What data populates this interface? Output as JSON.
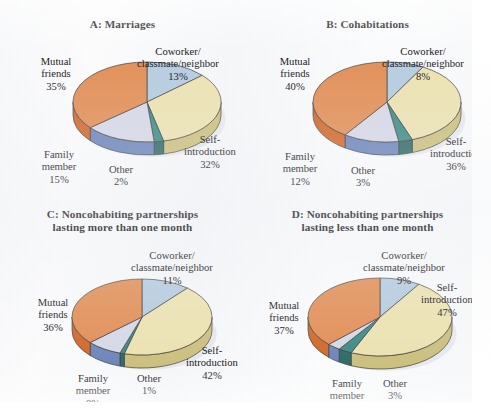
{
  "figure": {
    "background_color": "#f7f8fa",
    "text_color": "#17171a"
  },
  "palette": {
    "coworker": "#b6cce0",
    "coworker_side": "#8fa9c4",
    "self_introduction": "#ece2b2",
    "self_introduction_side": "#ccc07f",
    "other": "#3f8c87",
    "other_side": "#2e6c68",
    "family_member": "#d6d9e6",
    "family_member_side": "#6e86bb",
    "mutual_friends": "#e29058",
    "mutual_friends_side": "#d2692b",
    "outline": "#3d3d3d",
    "shadow": "#d9dde2"
  },
  "categories": [
    "Coworker/\nclassmate/neighbor",
    "Self-\nintroduction",
    "Other",
    "Family\nmember",
    "Mutual\nfriends"
  ],
  "panels": [
    {
      "id": "A",
      "title": "A: Marriages",
      "labels": {
        "mutual_friends": "Mutual\nfriends",
        "mutual_friends_pct": "35%",
        "coworker": "Coworker/\nclassmate/neighbor",
        "coworker_pct": "13%",
        "self_introduction": "Self-\nintroduction",
        "self_introduction_pct": "32%",
        "other": "Other",
        "other_pct": "2%",
        "family_member": "Family\nmember",
        "family_member_pct": "15%"
      }
    },
    {
      "id": "B",
      "title": "B: Cohabitations",
      "labels": {
        "mutual_friends": "Mutual\nfriends",
        "mutual_friends_pct": "40%",
        "coworker": "Coworker/\nclassmate/neighbor",
        "coworker_pct": "8%",
        "self_introduction": "Self-\nintroduction",
        "self_introduction_pct": "36%",
        "other": "Other",
        "other_pct": "3%",
        "family_member": "Family\nmember",
        "family_member_pct": "12%"
      }
    },
    {
      "id": "C",
      "title": "C: Noncohabiting partnerships\nlasting more than one month",
      "labels": {
        "mutual_friends": "Mutual\nfriends",
        "mutual_friends_pct": "36%",
        "coworker": "Coworker/\nclassmate/neighbor",
        "coworker_pct": "11%",
        "self_introduction": "Self-\nintroduction",
        "self_introduction_pct": "42%",
        "other": "Other",
        "other_pct": "1%",
        "family_member": "Family\nmember",
        "family_member_pct": "8%"
      }
    },
    {
      "id": "D",
      "title": "D: Noncohabiting partnerships\nlasting less than one month",
      "labels": {
        "mutual_friends": "Mutual\nfriends",
        "mutual_friends_pct": "37%",
        "coworker": "Coworker/\nclassmate/neighbor",
        "coworker_pct": "9%",
        "self_introduction": "Self-\nintroduction",
        "self_introduction_pct": "47%",
        "other": "Other",
        "other_pct": "3%",
        "family_member": "Family\nmember",
        "family_member_pct": "3%"
      }
    }
  ],
  "chart_data": [
    {
      "type": "pie",
      "title": "A: Marriages",
      "labels": [
        "Coworker/classmate/neighbor",
        "Self-introduction",
        "Other",
        "Family member",
        "Mutual friends"
      ],
      "values": [
        13,
        32,
        2,
        15,
        35
      ],
      "unit": "%",
      "legend": "none",
      "start_angle_deg": 0,
      "direction": "clockwise",
      "style": "3d-pie"
    },
    {
      "type": "pie",
      "title": "B: Cohabitations",
      "labels": [
        "Coworker/classmate/neighbor",
        "Self-introduction",
        "Other",
        "Family member",
        "Mutual friends"
      ],
      "values": [
        8,
        36,
        3,
        12,
        40
      ],
      "unit": "%",
      "legend": "none",
      "start_angle_deg": 0,
      "direction": "clockwise",
      "style": "3d-pie"
    },
    {
      "type": "pie",
      "title": "C: Noncohabiting partnerships lasting more than one month",
      "labels": [
        "Coworker/classmate/neighbor",
        "Self-introduction",
        "Other",
        "Family member",
        "Mutual friends"
      ],
      "values": [
        11,
        42,
        1,
        8,
        36
      ],
      "unit": "%",
      "legend": "none",
      "start_angle_deg": 0,
      "direction": "clockwise",
      "style": "3d-pie"
    },
    {
      "type": "pie",
      "title": "D: Noncohabiting partnerships lasting less than one month",
      "labels": [
        "Coworker/classmate/neighbor",
        "Self-introduction",
        "Other",
        "Family member",
        "Mutual friends"
      ],
      "values": [
        9,
        47,
        3,
        3,
        37
      ],
      "unit": "%",
      "legend": "none",
      "start_angle_deg": 0,
      "direction": "clockwise",
      "style": "3d-pie"
    }
  ]
}
